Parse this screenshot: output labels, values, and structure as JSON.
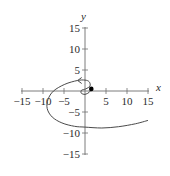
{
  "chart_data": {
    "type": "line",
    "title": "",
    "xlabel": "x",
    "ylabel": "y",
    "xlim": [
      -15,
      15
    ],
    "ylim": [
      -15,
      15
    ],
    "grid": false,
    "legend": null,
    "x_ticks": [
      -15,
      -10,
      -5,
      5,
      10,
      15
    ],
    "x_tick_labels": [
      "−15",
      "−10",
      "−5",
      "5",
      "10",
      "15"
    ],
    "y_ticks": [
      15,
      10,
      5,
      -5,
      -10,
      -15
    ],
    "y_tick_labels": [
      "15",
      "10",
      "5",
      "−5",
      "−10",
      "−15"
    ],
    "series": [
      {
        "name": "spiral curve",
        "description": "Outward spiral starting at the marked point near (1.5, 0.5), looping around the origin counter-clockwise and extending to the right",
        "start_point": {
          "x": 1.5,
          "y": 0.5,
          "marker": "filled-dot"
        },
        "direction_arrow": {
          "x": -1.5,
          "y": 2.5,
          "points": "left"
        },
        "points": [
          [
            1.5,
            0.5
          ],
          [
            1.0,
            -0.3
          ],
          [
            0.0,
            -0.8
          ],
          [
            -0.9,
            -0.5
          ],
          [
            -0.8,
            0.2
          ],
          [
            0.2,
            0.5
          ],
          [
            1.2,
            1.2
          ],
          [
            1.0,
            2.2
          ],
          [
            0.0,
            2.6
          ],
          [
            -1.8,
            2.5
          ],
          [
            -4.8,
            1.6
          ],
          [
            -7.5,
            0.0
          ],
          [
            -8.8,
            -2.0
          ],
          [
            -9.0,
            -4.2
          ],
          [
            -7.8,
            -6.2
          ],
          [
            -5.5,
            -7.6
          ],
          [
            -2.5,
            -8.4
          ],
          [
            0.0,
            -8.6
          ],
          [
            4.0,
            -8.8
          ],
          [
            8.0,
            -8.5
          ],
          [
            12.0,
            -7.8
          ],
          [
            15.0,
            -7.0
          ]
        ]
      }
    ]
  },
  "colors": {
    "axis": "#6e6e6e",
    "curve": "#4a4a4a",
    "marker": "#000000",
    "text": "#2a2a2a"
  }
}
